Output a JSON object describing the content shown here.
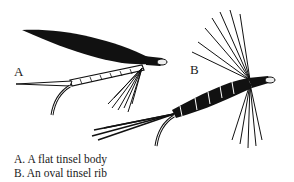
{
  "figure": {
    "labels": {
      "a": "A",
      "b": "B"
    },
    "caption": [
      "A. A flat tinsel body",
      "B. An oval tinsel rib"
    ],
    "colors": {
      "ink": "#111111",
      "paper": "#ffffff"
    }
  }
}
